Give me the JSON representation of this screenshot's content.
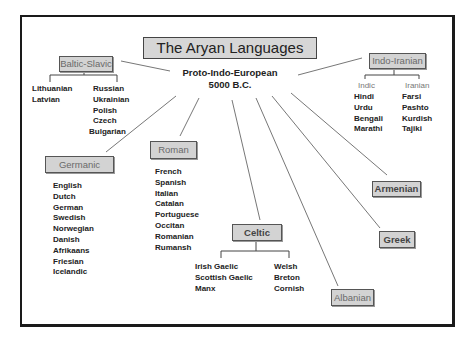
{
  "title": "The Aryan Languages",
  "root": {
    "name": "Proto-Indo-European",
    "date": "5000 B.C."
  },
  "branches": {
    "baltic_slavic": {
      "label": "Baltic-Slavic",
      "baltic": [
        "Lithuanian",
        "Latvian"
      ],
      "slavic": [
        "Russian",
        "Ukrainian",
        "Polish",
        "Czech",
        "Bulgarian"
      ]
    },
    "indo_iranian": {
      "label": "Indo-Iranian",
      "indic_label": "Indic",
      "indic": [
        "Hindi",
        "Urdu",
        "Bengali",
        "Marathi"
      ],
      "iranian_label": "Iranian",
      "iranian": [
        "Farsi",
        "Pashto",
        "Kurdish",
        "Tajiki"
      ]
    },
    "germanic": {
      "label": "Germanic",
      "languages": [
        "English",
        "Dutch",
        "German",
        "Swedish",
        "Norwegian",
        "Danish",
        "Afrikaans",
        "Friesian",
        "Icelandic"
      ]
    },
    "roman": {
      "label": "Roman",
      "languages": [
        "French",
        "Spanish",
        "Italian",
        "Catalan",
        "Portuguese",
        "Occitan",
        "Romanian",
        "Rumansh"
      ]
    },
    "celtic": {
      "label": "Celtic",
      "gaelic": [
        "Irish Gaelic",
        "Scottish Gaelic",
        "Manx"
      ],
      "brythonic": [
        "Welsh",
        "Breton",
        "Cornish"
      ]
    },
    "albanian": {
      "label": "Albanian"
    },
    "greek": {
      "label": "Greek"
    },
    "armenian": {
      "label": "Armenian"
    }
  }
}
